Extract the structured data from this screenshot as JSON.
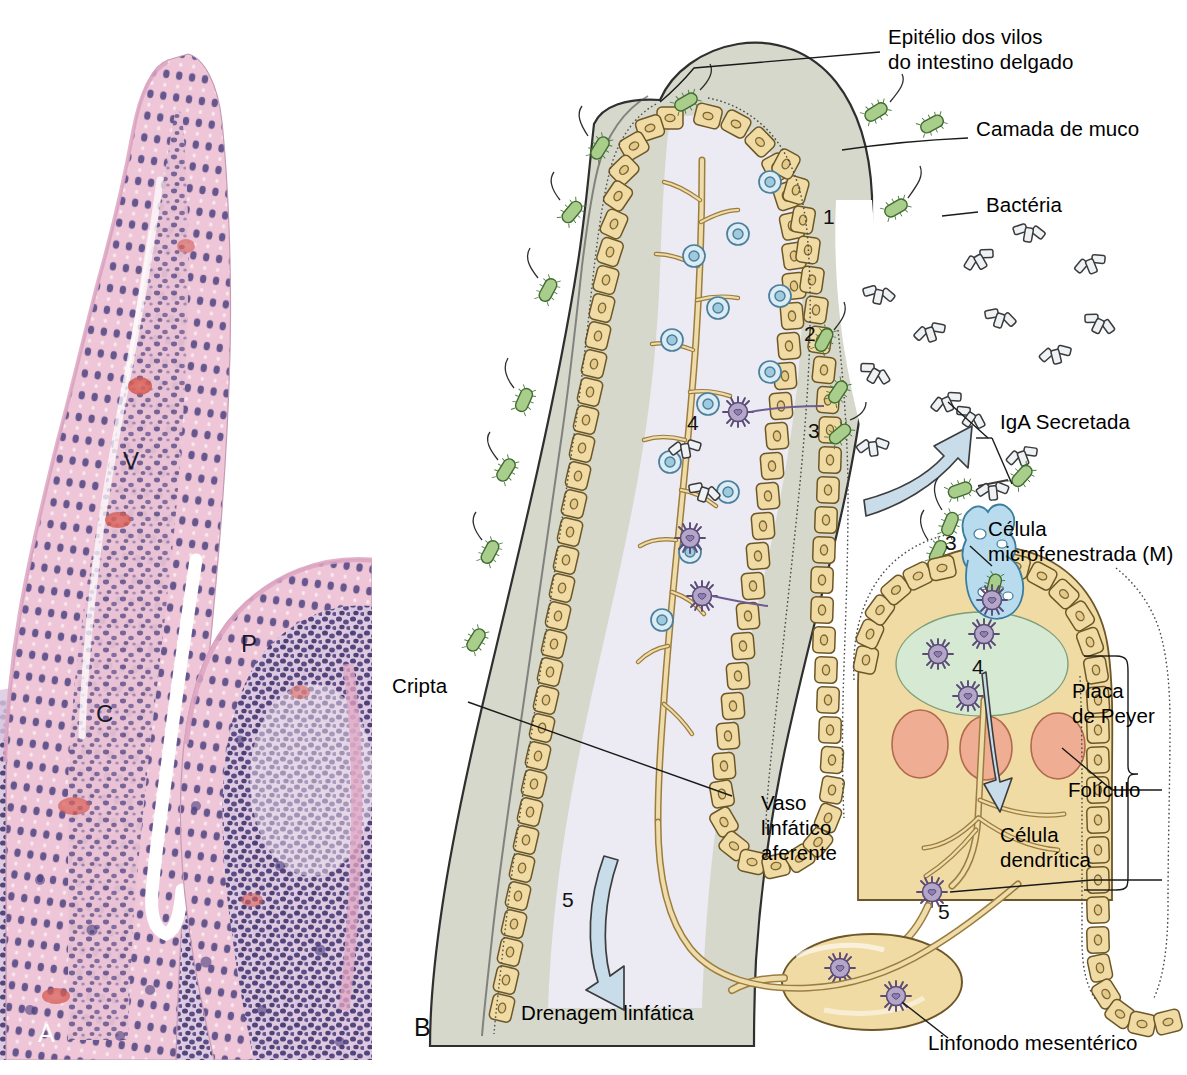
{
  "figure": {
    "panels": [
      {
        "id": "A",
        "letter": "A",
        "type": "histology-micrograph",
        "structure_labels": [
          {
            "key": "V",
            "text": "V",
            "meaning": "vilo"
          },
          {
            "key": "P",
            "text": "P",
            "meaning": "placa de Peyer"
          },
          {
            "key": "C",
            "text": "C",
            "meaning": "cripta"
          }
        ]
      },
      {
        "id": "B",
        "letter": "B",
        "type": "schematic-diagram"
      }
    ]
  },
  "labels": {
    "epitelio": "Epitélio dos vilos\ndo intestino delgado",
    "camada_muco": "Camada de muco",
    "bacteria": "Bactéria",
    "iga": "IgA Secretada",
    "celula_m": "Célula\nmicrofenestrada (M)",
    "placa_peyer": "Placa\nde Peyer",
    "foliculo": "Folículo",
    "celula_dendritica": "Célula\ndendrítica",
    "linfonodo": "Linfonodo mesentérico",
    "cripta": "Cripta",
    "vaso_linfatico": "Vaso\nlinfático\naferente",
    "drenagem": "Drenagem linfática"
  },
  "step_numbers": [
    {
      "id": "n1",
      "text": "1"
    },
    {
      "id": "n2",
      "text": "2"
    },
    {
      "id": "n3_mucus",
      "text": "3"
    },
    {
      "id": "n4_villus",
      "text": "4"
    },
    {
      "id": "n3_mcell",
      "text": "3"
    },
    {
      "id": "n4_dome",
      "text": "4"
    },
    {
      "id": "n5_lymph",
      "text": "5"
    },
    {
      "id": "n5_node",
      "text": "5"
    }
  ],
  "colors": {
    "background": "#ffffff",
    "epithelium": "#f0dba4",
    "epithelium_stroke": "#8a6e35",
    "mucus": "#d5d8cb",
    "mucus_stroke": "#2a2a2a",
    "lamina_propria": "#eceaf2",
    "bacteria": "#a9ce8c",
    "bacteria_stroke": "#4d7a3b",
    "plasma_cell": "#cfe3ef",
    "plasma_cell_stroke": "#4b7f9c",
    "dendritic_cell": "#b3a6c8",
    "dendritic_stroke": "#5a4b78",
    "m_cell": "#b8dcee",
    "m_cell_stroke": "#3c7d9e",
    "dome": "#d6e9d2",
    "follicle": "#efae93",
    "follicle_stroke": "#b06a4c",
    "arrow": "#c8dde9",
    "arrow_stroke": "#3d3d3d",
    "antibody": "#e9edf1",
    "antibody_stroke": "#3a3a3a",
    "lymph_vessel": "#efdcab",
    "tissue_pink": "#e6b9cd",
    "nucleus_purple": "#53487e",
    "label_text": "#000000"
  }
}
